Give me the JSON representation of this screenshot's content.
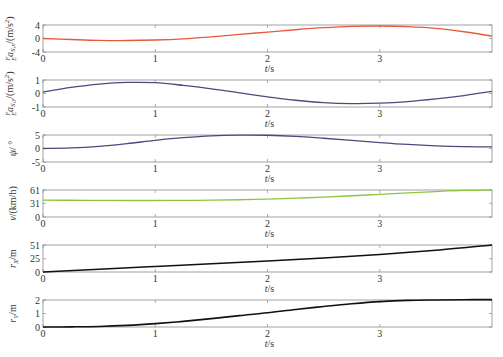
{
  "chart_data": [
    {
      "type": "line",
      "panel": 1,
      "ylabel": "ᴱᶠa_{S,x}/(m/s²)",
      "ylabel_text": "a_S,x/(m/s²)",
      "xlabel": "t/s",
      "ylim": [
        -4,
        4
      ],
      "yticks": [
        4,
        0,
        -4
      ],
      "xlim": [
        0,
        4
      ],
      "xticks": [
        0,
        1,
        2,
        3
      ],
      "color": "#e8583c",
      "x": [
        0,
        0.25,
        0.5,
        0.75,
        1.0,
        1.25,
        1.5,
        1.75,
        2.0,
        2.25,
        2.5,
        2.75,
        3.0,
        3.25,
        3.5,
        3.75,
        4.0
      ],
      "y": [
        0.0,
        -0.3,
        -0.55,
        -0.6,
        -0.45,
        -0.1,
        0.5,
        1.2,
        1.9,
        2.6,
        3.2,
        3.6,
        3.7,
        3.5,
        3.0,
        2.0,
        0.7
      ]
    },
    {
      "type": "line",
      "panel": 2,
      "ylabel_text": "a_S,y/(m/s²)",
      "xlabel": "t/s",
      "ylim": [
        -1,
        1
      ],
      "yticks": [
        1,
        0,
        -1
      ],
      "xlim": [
        0,
        4
      ],
      "xticks": [
        0,
        1,
        2,
        3
      ],
      "color": "#4a4a80",
      "x": [
        0,
        0.25,
        0.5,
        0.75,
        1.0,
        1.25,
        1.5,
        1.75,
        2.0,
        2.25,
        2.5,
        2.75,
        3.0,
        3.25,
        3.5,
        3.75,
        4.0
      ],
      "y": [
        0.1,
        0.45,
        0.7,
        0.82,
        0.8,
        0.6,
        0.35,
        0.05,
        -0.25,
        -0.5,
        -0.68,
        -0.75,
        -0.72,
        -0.6,
        -0.4,
        -0.15,
        0.15
      ]
    },
    {
      "type": "line",
      "panel": 3,
      "ylabel_text": "ψ/°",
      "xlabel": "t/s",
      "ylim": [
        -5,
        5
      ],
      "yticks": [
        5,
        0,
        -5
      ],
      "xlim": [
        0,
        4
      ],
      "xticks": [
        0,
        1,
        2,
        3
      ],
      "color": "#4a4a80",
      "x": [
        0,
        0.25,
        0.5,
        0.75,
        1.0,
        1.25,
        1.5,
        1.75,
        2.0,
        2.25,
        2.5,
        2.75,
        3.0,
        3.25,
        3.5,
        3.75,
        4.0
      ],
      "y": [
        0.0,
        0.2,
        0.8,
        1.8,
        3.0,
        4.0,
        4.7,
        4.95,
        4.9,
        4.5,
        3.8,
        3.0,
        2.2,
        1.5,
        1.0,
        0.7,
        0.6
      ]
    },
    {
      "type": "line",
      "panel": 4,
      "ylabel_text": "v/(km/h)",
      "xlabel": "t/s",
      "ylim": [
        0,
        61
      ],
      "yticks": [
        61,
        31,
        0
      ],
      "xlim": [
        0,
        4
      ],
      "xticks": [
        0,
        1,
        2,
        3
      ],
      "color": "#8cc63f",
      "x": [
        0,
        0.25,
        0.5,
        0.75,
        1.0,
        1.25,
        1.5,
        1.75,
        2.0,
        2.25,
        2.5,
        2.75,
        3.0,
        3.25,
        3.5,
        3.75,
        4.0
      ],
      "y": [
        38,
        37.8,
        37.5,
        37.3,
        37.3,
        37.5,
        38,
        39,
        40.5,
        42.5,
        45,
        48,
        51,
        54.5,
        57.5,
        60,
        61
      ]
    },
    {
      "type": "line",
      "panel": 5,
      "ylabel_text": "r_X/m",
      "xlabel": "t/s",
      "ylim": [
        0,
        51
      ],
      "yticks": [
        51,
        25,
        0
      ],
      "xlim": [
        0,
        4
      ],
      "xticks": [
        0,
        1,
        2,
        3
      ],
      "color": "#111111",
      "x": [
        0,
        0.5,
        1.0,
        1.5,
        2.0,
        2.5,
        3.0,
        3.5,
        4.0
      ],
      "y": [
        0,
        5.3,
        10.5,
        15.5,
        20.8,
        26.5,
        33,
        41,
        51
      ]
    },
    {
      "type": "line",
      "panel": 6,
      "ylabel_text": "r_Y/m",
      "xlabel": "t/s",
      "ylim": [
        0,
        2
      ],
      "yticks": [
        2,
        1,
        0
      ],
      "xlim": [
        0,
        4
      ],
      "xticks": [
        0,
        1,
        2,
        3
      ],
      "color": "#111111",
      "x": [
        0,
        0.25,
        0.5,
        0.75,
        1.0,
        1.25,
        1.5,
        1.75,
        2.0,
        2.25,
        2.5,
        2.75,
        3.0,
        3.25,
        3.5,
        3.75,
        4.0
      ],
      "y": [
        0.0,
        0.01,
        0.04,
        0.12,
        0.25,
        0.42,
        0.62,
        0.84,
        1.05,
        1.3,
        1.52,
        1.72,
        1.88,
        1.97,
        2.0,
        2.02,
        2.03
      ]
    }
  ],
  "labels": {
    "panel1": {
      "main": "a",
      "sub": "S,x",
      "pre": "F",
      "presub": "E",
      "unit": "/(m/s",
      "unit_sup": "2",
      "unit_end": ")"
    },
    "panel2": {
      "main": "a",
      "sub": "S,y",
      "pre": "F",
      "presub": "E",
      "unit": "/(m/s",
      "unit_sup": "2",
      "unit_end": ")"
    },
    "panel3": {
      "main": "ψ",
      "unit": "/ °"
    },
    "panel4": {
      "main": "v",
      "unit": "/(km/h)"
    },
    "panel5": {
      "main": "r",
      "sub": "X",
      "unit": "/m"
    },
    "panel6": {
      "main": "r",
      "sub": "Y",
      "unit": "/m"
    },
    "xlabel_t": "t",
    "xlabel_unit": "/s"
  }
}
